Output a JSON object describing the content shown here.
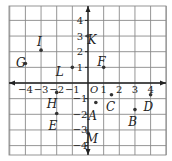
{
  "diagram": {
    "type": "coordinate-grid",
    "origin_label": "O",
    "x_ticks": [
      {
        "value": -4,
        "label": "−4"
      },
      {
        "value": -3,
        "label": "−3"
      },
      {
        "value": -2,
        "label": "−2"
      },
      {
        "value": -1,
        "label": "−1"
      },
      {
        "value": 1,
        "label": "1"
      },
      {
        "value": 2,
        "label": "2"
      },
      {
        "value": 3,
        "label": "3"
      },
      {
        "value": 4,
        "label": "4"
      }
    ],
    "y_ticks": [
      {
        "value": 4,
        "label": "4"
      },
      {
        "value": 3,
        "label": "3"
      },
      {
        "value": 2,
        "label": "2"
      },
      {
        "value": 1,
        "label": "1"
      },
      {
        "value": -1,
        "label": "−1"
      },
      {
        "value": -2,
        "label": "−2"
      },
      {
        "value": -3,
        "label": "−3"
      },
      {
        "value": -4,
        "label": "−4"
      }
    ],
    "points": [
      {
        "name": "K",
        "x": 0,
        "y": 3,
        "lx": 0.25,
        "ly": 2.75
      },
      {
        "name": "I",
        "x": -3,
        "y": 2.1,
        "lx": -3.1,
        "ly": 2.6
      },
      {
        "name": "G",
        "x": -4,
        "y": 1.25,
        "lx": -4.3,
        "ly": 1.3
      },
      {
        "name": "L",
        "x": -1,
        "y": 1,
        "lx": -1.8,
        "ly": 0.7
      },
      {
        "name": "F",
        "x": 1,
        "y": 1,
        "lx": 0.85,
        "ly": 1.35
      },
      {
        "name": "H",
        "x": -2,
        "y": -0.6,
        "lx": -2.3,
        "ly": -1.35
      },
      {
        "name": "E",
        "x": -2,
        "y": -1.95,
        "lx": -2.25,
        "ly": -2.75
      },
      {
        "name": "A",
        "x": 0.5,
        "y": -1.25,
        "lx": 0.3,
        "ly": -2.1
      },
      {
        "name": "C",
        "x": 1.5,
        "y": -0.75,
        "lx": 1.45,
        "ly": -1.55
      },
      {
        "name": "D",
        "x": 4,
        "y": -0.75,
        "lx": 3.85,
        "ly": -1.55
      },
      {
        "name": "B",
        "x": 3,
        "y": -1.7,
        "lx": 2.85,
        "ly": -2.5
      },
      {
        "name": "M",
        "x": 0,
        "y": -3.2,
        "lx": 0.25,
        "ly": -3.55
      }
    ],
    "colors": {
      "grid": "#8a8a8a",
      "axis": "#222222",
      "point": "#333333",
      "background": "#ffffff"
    }
  }
}
